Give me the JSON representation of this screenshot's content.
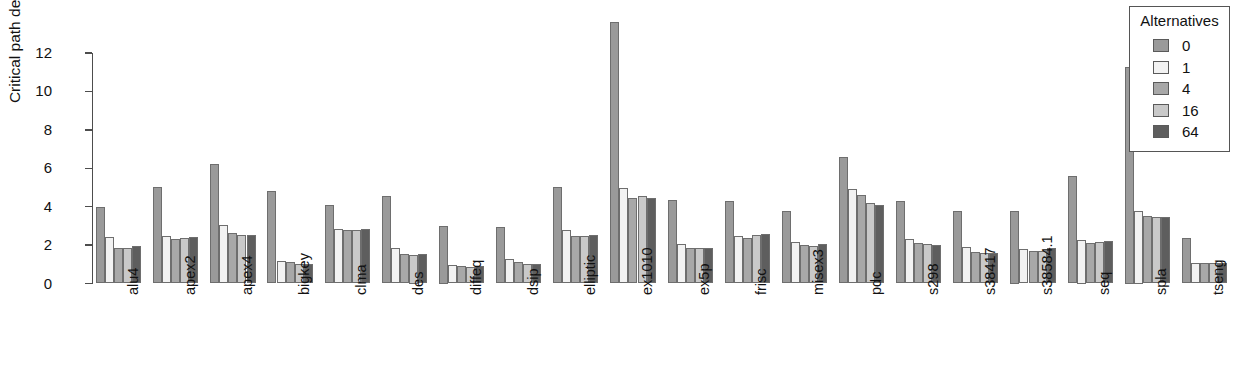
{
  "chart_data": {
    "type": "bar",
    "title": "",
    "subtitle": "",
    "xlabel": "",
    "ylabel": "Critical path delay (ns)",
    "ylim": [
      0,
      13.8
    ],
    "yticks": [
      0,
      2,
      4,
      6,
      8,
      10,
      12
    ],
    "ytick_labels": [
      "0",
      "2",
      "4",
      "6",
      "8",
      "10",
      "12"
    ],
    "grid": false,
    "legend": {
      "title": "Alternatives",
      "position": "top-right",
      "entries": [
        "0",
        "1",
        "4",
        "16",
        "64"
      ]
    },
    "series_colors": {
      "0": "#9a9a9a",
      "1": "#f2f2f2",
      "4": "#a8a8a8",
      "16": "#c9c9c9",
      "64": "#5e5e5e"
    },
    "categories": [
      "alu4",
      "apex2",
      "apex4",
      "bigkey",
      "clma",
      "des",
      "diffeq",
      "dsip",
      "elliptic",
      "ex1010",
      "ex5p",
      "frisc",
      "misex3",
      "pdc",
      "s298",
      "s38417",
      "s38584.1",
      "seq",
      "spla",
      "tseng"
    ],
    "series": [
      {
        "name": "0",
        "values": [
          4.0,
          5.0,
          6.2,
          4.8,
          4.1,
          4.55,
          3.0,
          2.95,
          5.0,
          13.6,
          4.35,
          4.3,
          3.8,
          6.6,
          4.3,
          3.8,
          3.75,
          5.6,
          11.25,
          2.35
        ]
      },
      {
        "name": "1",
        "values": [
          2.4,
          2.45,
          3.05,
          1.15,
          2.85,
          1.85,
          0.95,
          1.3,
          2.8,
          4.95,
          2.05,
          2.45,
          2.15,
          4.9,
          2.3,
          1.9,
          1.8,
          2.25,
          3.75,
          1.05
        ]
      },
      {
        "name": "4",
        "values": [
          1.85,
          2.3,
          2.65,
          1.1,
          2.8,
          1.55,
          0.9,
          1.1,
          2.45,
          4.45,
          1.85,
          2.35,
          2.0,
          4.6,
          2.1,
          1.65,
          1.7,
          2.1,
          3.5,
          1.05
        ]
      },
      {
        "name": "16",
        "values": [
          1.85,
          2.35,
          2.5,
          1.0,
          2.8,
          1.5,
          0.85,
          1.0,
          2.45,
          4.55,
          1.85,
          2.55,
          1.95,
          4.2,
          2.05,
          1.6,
          1.7,
          2.15,
          3.45,
          1.05
        ]
      },
      {
        "name": "64",
        "values": [
          1.95,
          2.4,
          2.55,
          1.0,
          2.85,
          1.55,
          0.9,
          1.0,
          2.5,
          4.45,
          1.85,
          2.6,
          2.05,
          4.1,
          2.0,
          1.6,
          1.85,
          2.2,
          3.45,
          1.05
        ]
      }
    ]
  }
}
